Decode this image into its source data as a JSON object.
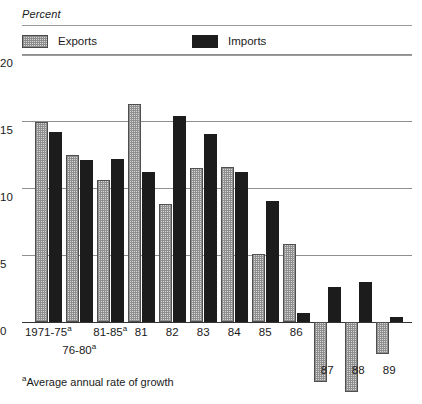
{
  "header": {
    "unit_label": "Percent"
  },
  "legend": {
    "position": "top",
    "items": [
      {
        "label": "Exports",
        "key": "exports",
        "color": "#d8d8d8",
        "pattern": "dotted-screen"
      },
      {
        "label": "Imports",
        "key": "imports",
        "color": "#1c1c1c",
        "pattern": "solid"
      }
    ]
  },
  "axis": {
    "y_ticks": [
      "20",
      "15",
      "10",
      "5",
      "0"
    ],
    "zero_label": "0"
  },
  "footnote": {
    "marker": "a",
    "text": "Average annual rate of growth"
  },
  "chart_data": {
    "type": "bar",
    "title": "",
    "subtitle": "",
    "xlabel": "",
    "ylabel": "Percent",
    "ylim": [
      -6,
      20
    ],
    "yticks": [
      0,
      5,
      10,
      15,
      20
    ],
    "grid": true,
    "legend_position": "top",
    "categories": [
      "1971-75a",
      "76-80a",
      "81-85a",
      "81",
      "82",
      "83",
      "84",
      "85",
      "86",
      "87",
      "88",
      "89"
    ],
    "category_labels": [
      {
        "text": "1971-75",
        "sup": "a",
        "row": 0
      },
      {
        "text": "76-80",
        "sup": "a",
        "row": 1
      },
      {
        "text": "81-85",
        "sup": "a",
        "row": 0
      },
      {
        "text": "81",
        "sup": "",
        "row": 0
      },
      {
        "text": "82",
        "sup": "",
        "row": 0
      },
      {
        "text": "83",
        "sup": "",
        "row": 0
      },
      {
        "text": "84",
        "sup": "",
        "row": 0
      },
      {
        "text": "85",
        "sup": "",
        "row": 0
      },
      {
        "text": "86",
        "sup": "",
        "row": 0
      },
      {
        "text": "87",
        "sup": "",
        "row": 2
      },
      {
        "text": "88",
        "sup": "",
        "row": 2
      },
      {
        "text": "89",
        "sup": "",
        "row": 2
      }
    ],
    "series": [
      {
        "name": "Exports",
        "color": "#d8d8d8",
        "values": [
          14.9,
          12.5,
          10.6,
          16.3,
          8.8,
          11.5,
          11.6,
          5.1,
          5.8,
          -4.5,
          -5.2,
          -2.4
        ]
      },
      {
        "name": "Imports",
        "color": "#1c1c1c",
        "values": [
          14.2,
          12.1,
          12.2,
          11.2,
          15.4,
          14.0,
          11.2,
          9.0,
          0.7,
          2.6,
          3.0,
          0.4
        ]
      }
    ]
  }
}
